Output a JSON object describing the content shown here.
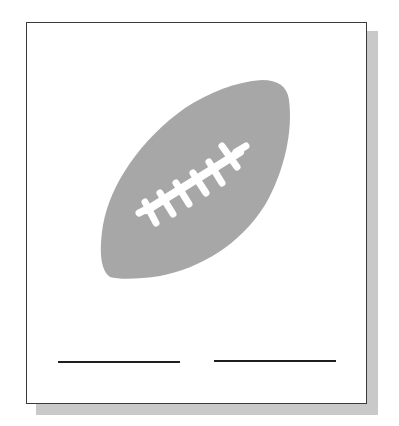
{
  "card": {
    "illustration": "football-icon",
    "answer_lines": [
      {
        "id": "left",
        "text": ""
      },
      {
        "id": "right",
        "text": ""
      }
    ]
  },
  "colors": {
    "ball": "#a7a7a7",
    "laces": "#ffffff",
    "border": "#3a3a3a",
    "shadow": "#c9c9c9",
    "line": "#1e1e1e"
  }
}
